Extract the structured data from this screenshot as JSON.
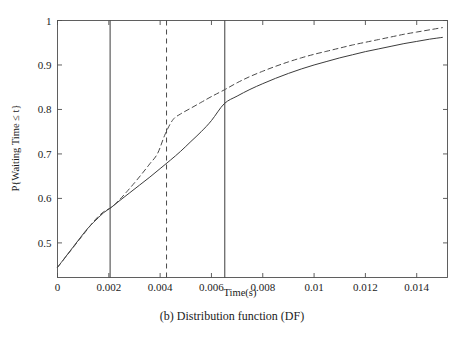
{
  "chart_data": {
    "type": "line",
    "title": "",
    "caption": "(b) Distribution function (DF)",
    "xlabel": "Time(s)",
    "ylabel": "P{Waiting Time ≤ t}",
    "xlim": [
      0,
      0.0152
    ],
    "ylim": [
      0.4222,
      1.0
    ],
    "grid": false,
    "legend": "none",
    "xticks": [
      0,
      0.002,
      0.004,
      0.006,
      0.008,
      0.01,
      0.012,
      0.014
    ],
    "xtick_labels": [
      "0",
      "0.002",
      "0.004",
      "0.006",
      "0.008",
      "0.01",
      "0.012",
      "0.014"
    ],
    "yticks": [
      0.5,
      0.6,
      0.7,
      0.8,
      0.9,
      1
    ],
    "ytick_labels": [
      "0.5",
      "0.6",
      "0.7",
      "0.8",
      "0.9",
      "1"
    ],
    "series": [
      {
        "name": "solid-curve",
        "style": "solid",
        "color": "#3c3c3c",
        "points": [
          [
            0.0,
            0.445
          ],
          [
            0.0002,
            0.46
          ],
          [
            0.0004,
            0.475
          ],
          [
            0.0006,
            0.49
          ],
          [
            0.0008,
            0.505
          ],
          [
            0.001,
            0.52
          ],
          [
            0.0012,
            0.534
          ],
          [
            0.0014,
            0.546
          ],
          [
            0.0016,
            0.557
          ],
          [
            0.0018,
            0.568
          ],
          [
            0.0021,
            0.58
          ],
          [
            0.0024,
            0.594
          ],
          [
            0.0028,
            0.612
          ],
          [
            0.0032,
            0.63
          ],
          [
            0.0036,
            0.648
          ],
          [
            0.004,
            0.667
          ],
          [
            0.0044,
            0.686
          ],
          [
            0.0048,
            0.706
          ],
          [
            0.0052,
            0.728
          ],
          [
            0.0056,
            0.75
          ],
          [
            0.006,
            0.775
          ],
          [
            0.0065,
            0.813
          ],
          [
            0.007,
            0.83
          ],
          [
            0.0075,
            0.845
          ],
          [
            0.008,
            0.858
          ],
          [
            0.0085,
            0.87
          ],
          [
            0.009,
            0.881
          ],
          [
            0.0095,
            0.891
          ],
          [
            0.01,
            0.9
          ],
          [
            0.0105,
            0.908
          ],
          [
            0.011,
            0.916
          ],
          [
            0.0115,
            0.923
          ],
          [
            0.012,
            0.93
          ],
          [
            0.0125,
            0.936
          ],
          [
            0.013,
            0.942
          ],
          [
            0.0135,
            0.948
          ],
          [
            0.014,
            0.953
          ],
          [
            0.0145,
            0.958
          ],
          [
            0.015,
            0.962
          ]
        ]
      },
      {
        "name": "dashed-curve",
        "style": "dashed",
        "color": "#4a4a4a",
        "points": [
          [
            0.0,
            0.445
          ],
          [
            0.0003,
            0.467
          ],
          [
            0.0006,
            0.489
          ],
          [
            0.0009,
            0.511
          ],
          [
            0.0012,
            0.533
          ],
          [
            0.0015,
            0.554
          ],
          [
            0.0018,
            0.57
          ],
          [
            0.0021,
            0.58
          ],
          [
            0.0024,
            0.596
          ],
          [
            0.0027,
            0.615
          ],
          [
            0.003,
            0.635
          ],
          [
            0.0033,
            0.656
          ],
          [
            0.0036,
            0.678
          ],
          [
            0.0039,
            0.701
          ],
          [
            0.0042,
            0.745
          ],
          [
            0.0045,
            0.777
          ],
          [
            0.0048,
            0.79
          ],
          [
            0.0052,
            0.803
          ],
          [
            0.0056,
            0.816
          ],
          [
            0.006,
            0.829
          ],
          [
            0.0065,
            0.844
          ],
          [
            0.007,
            0.86
          ],
          [
            0.0075,
            0.874
          ],
          [
            0.008,
            0.886
          ],
          [
            0.0085,
            0.897
          ],
          [
            0.009,
            0.907
          ],
          [
            0.0095,
            0.916
          ],
          [
            0.01,
            0.924
          ],
          [
            0.0105,
            0.931
          ],
          [
            0.011,
            0.938
          ],
          [
            0.0115,
            0.945
          ],
          [
            0.012,
            0.951
          ],
          [
            0.0125,
            0.957
          ],
          [
            0.013,
            0.963
          ],
          [
            0.0135,
            0.969
          ],
          [
            0.014,
            0.974
          ],
          [
            0.0145,
            0.979
          ],
          [
            0.015,
            0.984
          ]
        ]
      }
    ],
    "vertical_lines": [
      {
        "name": "vline-solid-1",
        "x": 0.00205,
        "style": "solid",
        "color": "#3c3c3c"
      },
      {
        "name": "vline-dashed",
        "x": 0.00425,
        "style": "dashed",
        "color": "#4a4a4a"
      },
      {
        "name": "vline-solid-2",
        "x": 0.00652,
        "style": "solid",
        "color": "#3c3c3c"
      }
    ],
    "annotations": []
  }
}
